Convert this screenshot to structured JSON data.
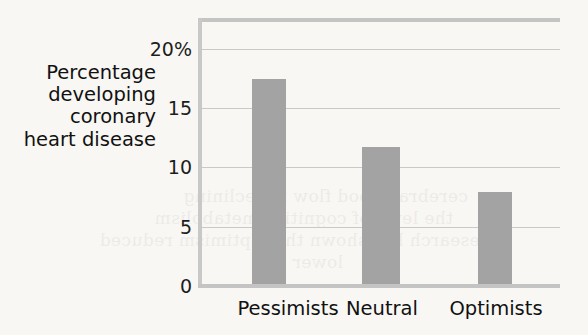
{
  "chart_data": {
    "type": "bar",
    "title": "",
    "xlabel": "",
    "ylabel": "Percentage developing coronary heart disease",
    "ylabel_lines": [
      "Percentage",
      "developing",
      "coronary",
      "heart disease"
    ],
    "categories": [
      "Pessimists",
      "Neutral",
      "Optimists"
    ],
    "values": [
      17.4,
      11.7,
      7.9
    ],
    "ylim": [
      0,
      22.4
    ],
    "yticks": [
      0,
      5,
      10,
      15,
      20
    ],
    "ytick_labels": [
      "0",
      "5",
      "10",
      "15",
      "20%"
    ],
    "grid": "horizontal",
    "legend": "none",
    "bar_color": "#a3a3a3",
    "gridline_color": "#c9c9c9",
    "axis_color": "#c4c4c4",
    "background_color": "#f8f7f4",
    "text_color": "#111111"
  },
  "bleed_through": [
    "cerebral blood flow is declining",
    "the level of cognitive metabolism",
    "Research has shown that optimism reduced",
    "lower"
  ]
}
